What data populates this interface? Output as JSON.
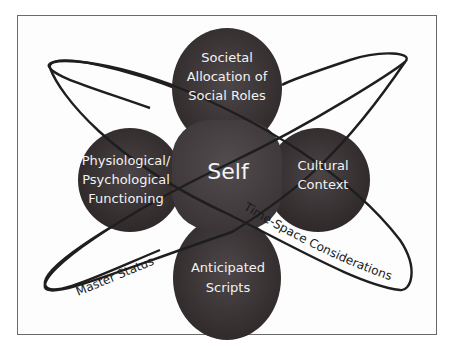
{
  "diagram": {
    "center": {
      "label": "Self"
    },
    "nodes": {
      "top": {
        "lines": [
          "Societal",
          "Allocation of",
          "Social Roles"
        ]
      },
      "left": {
        "lines": [
          "Physiological/",
          "Psychological",
          "Functioning"
        ]
      },
      "right": {
        "lines": [
          "Cultural",
          "Context"
        ]
      },
      "bottom": {
        "lines": [
          "Anticipated",
          "Scripts"
        ]
      }
    },
    "orbits": {
      "master_status": {
        "label": "Master Status"
      },
      "time_space": {
        "label": "Time-Space Considerations"
      }
    },
    "colors": {
      "node_fill": "#3b3436",
      "node_fill_light": "#4a4446",
      "center_fill": "#454042",
      "orbit_stroke": "#1e1e1e",
      "frame_stroke": "#6a6a6a",
      "label_text": "#f2f2f2"
    }
  }
}
